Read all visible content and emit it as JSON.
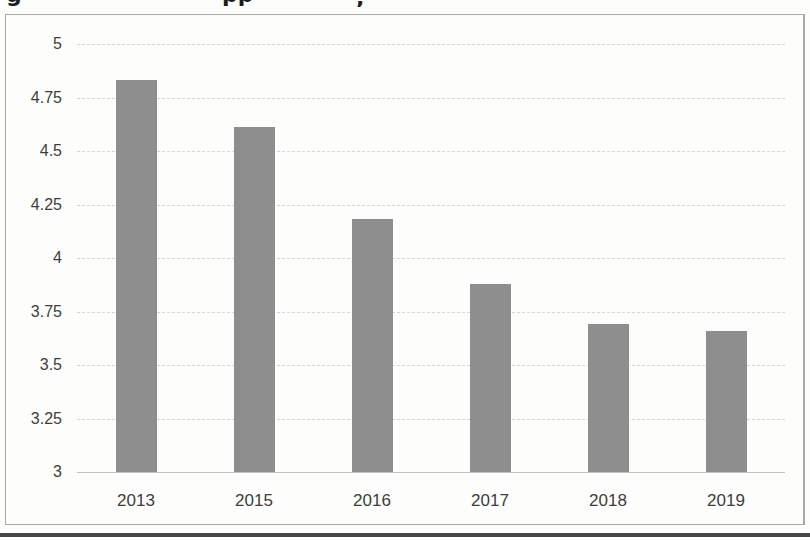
{
  "chart_data": {
    "type": "bar",
    "title": "",
    "categories": [
      "2013",
      "2015",
      "2016",
      "2017",
      "2018",
      "2019"
    ],
    "values": [
      4.83,
      4.61,
      4.18,
      3.88,
      3.69,
      3.66
    ],
    "xlabel": "",
    "ylabel": "",
    "ylim": [
      3,
      5
    ],
    "ytick_step": 0.25,
    "ytick_labels": [
      "5",
      "4.75",
      "4.5",
      "4.25",
      "4",
      "3.75",
      "3.5",
      "3.25",
      "3"
    ],
    "grid": true,
    "legend": "none",
    "bar_color": "#8e8e8e"
  },
  "cropped_title": {
    "fragments": [
      {
        "glyph": "g"
      },
      {
        "glyph": "pp"
      },
      {
        "glyph": ","
      }
    ]
  },
  "colors": {
    "bar": "#8e8e8e",
    "gridline": "#d6d6d6",
    "baseline": "#c2c2c2",
    "frame_border": "#a9a9a9",
    "label": "#3d3d3d",
    "bottom_rule": "#454545",
    "background": "#fdfdfc"
  }
}
